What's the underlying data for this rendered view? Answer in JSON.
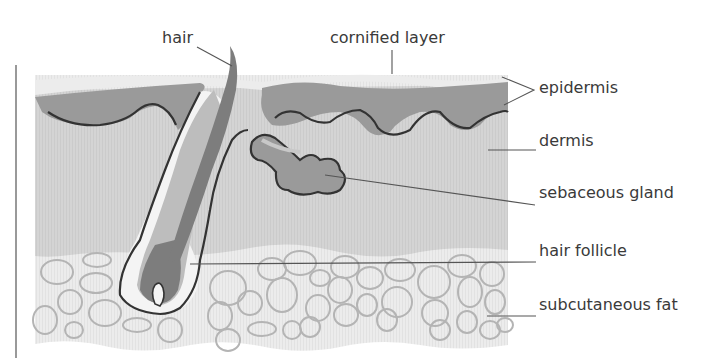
{
  "diagram": {
    "labels": {
      "hair": "hair",
      "cornified_layer": "cornified layer",
      "epidermis": "epidermis",
      "dermis": "dermis",
      "sebaceous_gland": "sebaceous gland",
      "hair_follicle": "hair follicle",
      "subcutaneous_fat": "subcutaneous fat"
    },
    "colors": {
      "cornified": "#ececec",
      "epidermis": "#9a9a9a",
      "dermis": "#d6d6d6",
      "fat_layer": "#ececec",
      "fat_cell_stroke": "#b4b4b4",
      "outline": "#333333",
      "hair_shaft": "#7d7d7d",
      "leader_line": "#555555",
      "text": "#3a3a3a"
    }
  }
}
